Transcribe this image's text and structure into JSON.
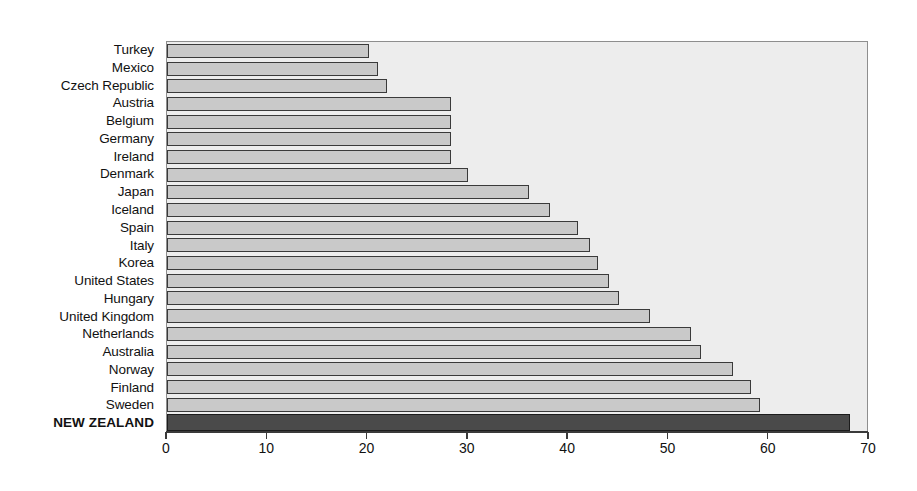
{
  "chart_data": {
    "type": "bar",
    "orientation": "horizontal",
    "title": "",
    "subtitle": "",
    "xlabel": "",
    "ylabel": "",
    "xlim": [
      0,
      70
    ],
    "xticks": [
      0,
      10,
      20,
      30,
      40,
      50,
      60,
      70
    ],
    "xtick_labels": [
      "0",
      "10",
      "20",
      "30",
      "40",
      "50",
      "60",
      "70"
    ],
    "grid": false,
    "legend": null,
    "highlight_category": "NEW ZEALAND",
    "colors": {
      "bar_fill": "#c9c9c9",
      "bar_edge": "#3a3a3a",
      "highlight_fill": "#4a4a4a",
      "highlight_edge": "#1c1c1c",
      "plot_background": "#ededed",
      "page_background": "#ffffff",
      "axis": "#3a3a3a",
      "text": "#111111"
    },
    "categories": [
      "Turkey",
      "Mexico",
      "Czech Republic",
      "Austria",
      "Belgium",
      "Germany",
      "Ireland",
      "Denmark",
      "Japan",
      "Iceland",
      "Spain",
      "Italy",
      "Korea",
      "United States",
      "Hungary",
      "United Kingdom",
      "Netherlands",
      "Australia",
      "Norway",
      "Finland",
      "Sweden",
      "NEW ZEALAND"
    ],
    "values": [
      20.1,
      21.0,
      21.9,
      28.3,
      28.3,
      28.3,
      28.3,
      30.0,
      36.1,
      38.2,
      41.0,
      42.2,
      43.0,
      44.1,
      45.1,
      48.2,
      52.3,
      53.2,
      56.4,
      58.2,
      59.1,
      68.1
    ]
  }
}
